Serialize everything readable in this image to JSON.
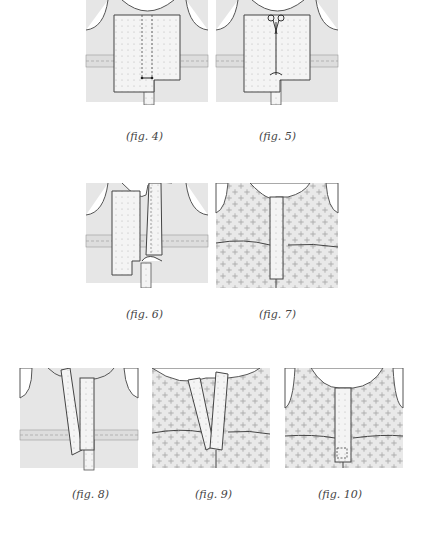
{
  "page": {
    "type": "sewing instructions illustration page",
    "colors": {
      "background": "#ffffff",
      "garment": "#e6e6e6",
      "outline": "#555555",
      "facing": "#f2f2f2",
      "print": "#bdbdbd"
    }
  },
  "figures": [
    {
      "id": "fig4",
      "caption": "(fig. 4)",
      "description": "Placket facing pinned over center front with stitch lines"
    },
    {
      "id": "fig5",
      "caption": "(fig. 5)",
      "description": "Scissors cutting placket slit between stitching lines",
      "icon": "scissors-icon"
    },
    {
      "id": "fig6",
      "caption": "(fig. 6)",
      "description": "Facing folded and turned to reveal one side"
    },
    {
      "id": "fig7",
      "caption": "(fig. 7)",
      "description": "Patterned fabric with placket stitched closed"
    },
    {
      "id": "fig8",
      "caption": "(fig. 8)",
      "description": "Placket strips folded at an angle"
    },
    {
      "id": "fig9",
      "caption": "(fig. 9)",
      "description": "Patterned fabric with placket strips at an angle"
    },
    {
      "id": "fig10",
      "caption": "(fig. 10)",
      "description": "Finished placket on patterned fabric with box stitch"
    }
  ]
}
